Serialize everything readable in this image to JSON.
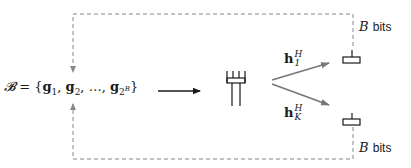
{
  "diagram": {
    "codebook": {
      "symbol": "𝓑",
      "equals": " = {",
      "vectors": [
        {
          "base": "g",
          "sub": "1"
        },
        {
          "base": "g",
          "sub": "2"
        },
        {
          "base": "g",
          "sub": "2",
          "sup": "B"
        }
      ],
      "ellipsis": "…",
      "close": "}"
    },
    "channels": [
      {
        "vec": "h",
        "sup": "H",
        "sub": "1"
      },
      {
        "vec": "h",
        "sup": "H",
        "sub": "K"
      }
    ],
    "feedback": [
      {
        "var": "B",
        "unit": "bits",
        "position": "top"
      },
      {
        "var": "B",
        "unit": "bits",
        "position": "bottom"
      }
    ],
    "nodes": [
      "base-station-antenna-array",
      "user-1",
      "user-K"
    ],
    "colors": {
      "line": "#1a1a1a",
      "channel_arrow": "#777777",
      "dashed": "#888888"
    }
  }
}
